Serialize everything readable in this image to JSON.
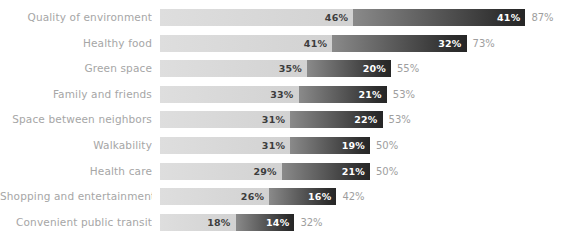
{
  "chart_data": {
    "type": "bar",
    "subtype": "stacked-horizontal",
    "title": "",
    "subtitle": "",
    "xlabel": "",
    "ylabel": "",
    "grid": false,
    "legend_position": "none",
    "xlim": [
      0,
      87
    ],
    "value_suffix": "%",
    "categories": [
      "Quality of environment",
      "Healthy  food",
      "Green space",
      "Family and friends",
      "Space between neighbors",
      "Walkability",
      "Health care",
      "Shopping and entertainment",
      "Convenient public transit"
    ],
    "series": [
      {
        "name": "first",
        "color": "#d6d6d6",
        "values": [
          46,
          41,
          35,
          33,
          31,
          31,
          29,
          26,
          18
        ],
        "labels": [
          "46%",
          "41%",
          "35%",
          "33%",
          "31%",
          "31%",
          "29%",
          "26%",
          "18%"
        ]
      },
      {
        "name": "second",
        "color": "#3a3a3a",
        "values": [
          41,
          32,
          20,
          21,
          22,
          19,
          21,
          16,
          14
        ],
        "labels": [
          "41%",
          "32%",
          "20%",
          "21%",
          "22%",
          "19%",
          "21%",
          "16%",
          "14%"
        ]
      }
    ],
    "totals": [
      87,
      73,
      55,
      53,
      53,
      50,
      50,
      42,
      32
    ],
    "total_labels": [
      "87%",
      "73%",
      "55%",
      "53%",
      "53%",
      "50%",
      "50%",
      "42%",
      "32%"
    ]
  },
  "rows": [
    {
      "label": "Quality of environment",
      "a": 46,
      "a_label": "46%",
      "b": 41,
      "b_label": "41%",
      "total_label": "87%"
    },
    {
      "label": "Healthy  food",
      "a": 41,
      "a_label": "41%",
      "b": 32,
      "b_label": "32%",
      "total_label": "73%"
    },
    {
      "label": "Green space",
      "a": 35,
      "a_label": "35%",
      "b": 20,
      "b_label": "20%",
      "total_label": "55%"
    },
    {
      "label": "Family and friends",
      "a": 33,
      "a_label": "33%",
      "b": 21,
      "b_label": "21%",
      "total_label": "53%"
    },
    {
      "label": "Space between neighbors",
      "a": 31,
      "a_label": "31%",
      "b": 22,
      "b_label": "22%",
      "total_label": "53%"
    },
    {
      "label": "Walkability",
      "a": 31,
      "a_label": "31%",
      "b": 19,
      "b_label": "19%",
      "total_label": "50%"
    },
    {
      "label": "Health care",
      "a": 29,
      "a_label": "29%",
      "b": 21,
      "b_label": "21%",
      "total_label": "50%"
    },
    {
      "label": "Shopping and entertainment",
      "a": 26,
      "a_label": "26%",
      "b": 16,
      "b_label": "16%",
      "total_label": "42%"
    },
    {
      "label": "Convenient public transit",
      "a": 18,
      "a_label": "18%",
      "b": 14,
      "b_label": "14%",
      "total_label": "32%"
    }
  ],
  "layout": {
    "bar_origin_x": 160,
    "px_per_percent": 4.2,
    "row_pitch": 25.6,
    "first_row_top": 9,
    "bar_height": 17
  },
  "colors": {
    "background": "#ffffff",
    "segment_a": "#d6d6d6",
    "segment_b_start": "#8a8a8a",
    "segment_b_end": "#2a2a2a",
    "category_label": "#a6a6a6",
    "total_label": "#9e9e9e",
    "value_on_light": "#3d3d3d",
    "value_on_dark": "#ffffff"
  }
}
